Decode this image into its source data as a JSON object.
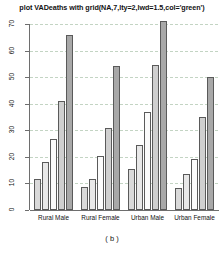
{
  "caption": "( b )",
  "chart_data": {
    "type": "bar",
    "title": "plot VADeaths with grid(NA,7,lty=2,lwd=1.5,col='green')",
    "xlabel": "",
    "ylabel": "",
    "ylim": [
      0,
      70
    ],
    "yticks": [
      0,
      10,
      20,
      30,
      40,
      50,
      60,
      70
    ],
    "grid": "horizontal dashed green, 7 cells",
    "legend": "none",
    "grouped": "beside",
    "categories": [
      "Rural Male",
      "Rural Female",
      "Urban Male",
      "Urban Female"
    ],
    "series": [
      {
        "name": "50-54",
        "values": [
          11.7,
          8.7,
          15.4,
          8.4
        ],
        "color": "#d9d9d9"
      },
      {
        "name": "55-59",
        "values": [
          18.1,
          11.7,
          24.3,
          13.6
        ],
        "color": "#e8e8e8"
      },
      {
        "name": "60-64",
        "values": [
          26.9,
          20.3,
          37.0,
          19.3
        ],
        "color": "#fbfbfb"
      },
      {
        "name": "65-69",
        "values": [
          41.0,
          30.9,
          54.6,
          35.1
        ],
        "color": "#cfcfcf"
      },
      {
        "name": "70-74",
        "values": [
          66.0,
          54.3,
          71.1,
          50.0
        ],
        "color": "#a8a8a8"
      }
    ]
  }
}
